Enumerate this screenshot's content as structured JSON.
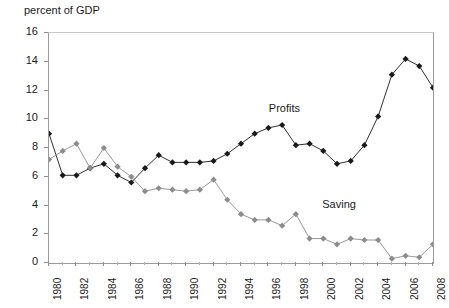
{
  "chart_data": {
    "type": "line",
    "title": "",
    "ylabel": "percent of GDP",
    "xlabel": "",
    "ylim": [
      0,
      16
    ],
    "ytick_step": 2,
    "yticks": [
      "0",
      "2",
      "4",
      "6",
      "8",
      "10",
      "12",
      "14",
      "16"
    ],
    "grid": false,
    "legend_position": "inline-annotation",
    "x": [
      1980,
      1981,
      1982,
      1983,
      1984,
      1985,
      1986,
      1987,
      1988,
      1989,
      1990,
      1991,
      1992,
      1993,
      1994,
      1995,
      1996,
      1997,
      1998,
      1999,
      2000,
      2001,
      2002,
      2003,
      2004,
      2005,
      2006,
      2007,
      2008
    ],
    "xtick_labels": [
      "1980",
      "1982",
      "1984",
      "1986",
      "1988",
      "1990",
      "1992",
      "1994",
      "1996",
      "1998",
      "2000",
      "2002",
      "2004",
      "2006",
      "2008"
    ],
    "xtick_values": [
      1980,
      1982,
      1984,
      1986,
      1988,
      1990,
      1992,
      1994,
      1996,
      1998,
      2000,
      2002,
      2004,
      2006,
      2008
    ],
    "series": [
      {
        "name": "Profits",
        "color": "#1a1a1a",
        "marker": "diamond",
        "label_x": 1996.1,
        "label_y": 10.6,
        "values": [
          9.0,
          6.1,
          6.1,
          6.6,
          6.9,
          6.1,
          5.6,
          6.6,
          7.5,
          7.0,
          7.0,
          7.0,
          7.1,
          7.6,
          8.3,
          9.0,
          9.4,
          9.6,
          8.2,
          8.3,
          7.8,
          6.9,
          7.1,
          8.2,
          10.2,
          13.1,
          14.2,
          13.7,
          12.2
        ]
      },
      {
        "name": "Saving",
        "color": "#8c8c8c",
        "marker": "diamond",
        "label_x": 2000.0,
        "label_y": 3.9,
        "values": [
          7.2,
          7.8,
          8.3,
          6.6,
          8.0,
          6.7,
          6.0,
          5.0,
          5.2,
          5.1,
          5.0,
          5.1,
          5.8,
          4.4,
          3.4,
          3.0,
          3.0,
          2.6,
          3.4,
          1.7,
          1.7,
          1.3,
          1.7,
          1.6,
          1.6,
          0.3,
          0.5,
          0.4,
          1.3
        ]
      }
    ]
  }
}
